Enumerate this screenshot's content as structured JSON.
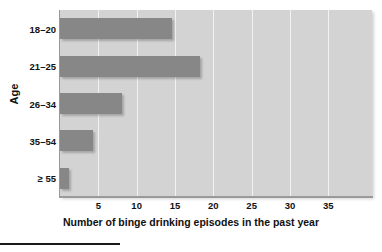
{
  "chart_data": {
    "type": "bar",
    "orientation": "horizontal",
    "title": "",
    "subtitle": "",
    "xlabel": "Number of binge drinking episodes in the past year",
    "ylabel": "Age",
    "categories": [
      "18–20",
      "21–25",
      "26–34",
      "35–54",
      "≥ 55"
    ],
    "values": [
      14.6,
      18.3,
      8.1,
      4.3,
      1.2
    ],
    "series": [
      {
        "name": "Binge drinking episodes",
        "values": [
          14.6,
          18.3,
          8.1,
          4.3,
          1.2
        ]
      }
    ],
    "xlim": [
      0,
      40.7
    ],
    "xticks": [
      5,
      10,
      15,
      20,
      25,
      30,
      35
    ],
    "xtick_labels": [
      "5",
      "10",
      "15",
      "20",
      "25",
      "30",
      "35"
    ],
    "grid": "vertical",
    "legend": "none",
    "colors": {
      "bar": "#878787",
      "plot_background": "#d3d3d3",
      "gridline": "#f2f2f2",
      "axis": "#9a9a9a",
      "text": "#111111",
      "figure_background": "#ffffff",
      "rule": "#1a1a1a"
    }
  }
}
